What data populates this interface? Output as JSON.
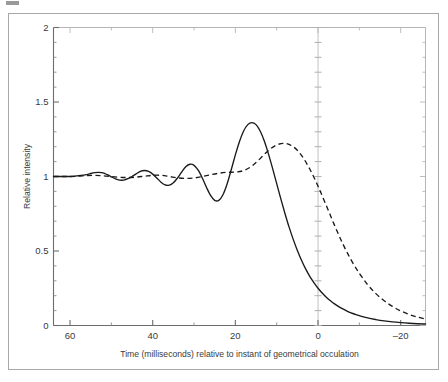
{
  "figure": {
    "corner_mark_name": "page-corner-mark",
    "frame_color": "#a8a8a8",
    "background_color": "#ffffff"
  },
  "chart_data": {
    "type": "line",
    "title": "",
    "subtitle": "",
    "xlabel": "Time (milliseconds) relative to instant of geometrical occulation",
    "ylabel": "Relative intensity",
    "xlim": [
      64,
      -26
    ],
    "ylim": [
      0,
      2
    ],
    "x_inverted": true,
    "grid": false,
    "zero_gridline": true,
    "legend": "none",
    "xticks": [
      60,
      40,
      20,
      0,
      -20
    ],
    "xtick_labels": [
      "60",
      "40",
      "20",
      "0",
      "–20"
    ],
    "xticks_minor": [
      50,
      30,
      10,
      -10
    ],
    "yticks": [
      0,
      0.5,
      1,
      1.5,
      2
    ],
    "ytick_labels": [
      "0",
      "0.5",
      "1",
      "1.5",
      "2"
    ],
    "yticks_minor": [
      0.1,
      0.2,
      0.3,
      0.4,
      0.6,
      0.7,
      0.8,
      0.9,
      1.1,
      1.2,
      1.3,
      1.4,
      1.6,
      1.7,
      1.8,
      1.9
    ],
    "series": [
      {
        "name": "monochromatic-fresnel-diffraction",
        "style": "solid",
        "color": "#1a1a1a",
        "x": [
          64,
          62,
          60,
          58,
          56,
          55,
          54,
          53,
          52,
          51,
          50,
          49,
          48,
          47,
          46,
          45,
          44,
          43,
          42,
          41,
          40,
          39,
          38,
          37,
          36,
          35,
          34,
          33,
          32,
          31,
          30,
          29,
          28,
          27,
          26,
          25,
          24,
          23,
          22,
          21,
          20,
          19,
          18,
          17,
          16,
          15,
          14,
          13,
          12,
          11,
          10,
          9,
          8,
          7,
          6,
          5,
          4,
          3,
          2,
          1,
          0,
          -1,
          -2,
          -3,
          -4,
          -5,
          -6,
          -7,
          -8,
          -9,
          -10,
          -12,
          -14,
          -16,
          -18,
          -20,
          -22,
          -24,
          -26
        ],
        "y": [
          1.0,
          1.0,
          1.0,
          1.005,
          1.012,
          1.02,
          1.026,
          1.028,
          1.024,
          1.012,
          0.998,
          0.984,
          0.976,
          0.976,
          0.985,
          1.0,
          1.018,
          1.034,
          1.04,
          1.034,
          1.016,
          0.99,
          0.962,
          0.944,
          0.942,
          0.958,
          0.99,
          1.03,
          1.065,
          1.082,
          1.075,
          1.042,
          0.99,
          0.928,
          0.873,
          0.84,
          0.84,
          0.878,
          0.95,
          1.045,
          1.145,
          1.235,
          1.305,
          1.348,
          1.362,
          1.348,
          1.305,
          1.238,
          1.152,
          1.055,
          0.952,
          0.85,
          0.752,
          0.66,
          0.578,
          0.504,
          0.438,
          0.38,
          0.33,
          0.288,
          0.25,
          0.218,
          0.19,
          0.166,
          0.145,
          0.127,
          0.111,
          0.097,
          0.085,
          0.075,
          0.066,
          0.051,
          0.04,
          0.031,
          0.024,
          0.019,
          0.015,
          0.012,
          0.01
        ]
      },
      {
        "name": "finite-source-size-smoothed",
        "style": "dashed",
        "color": "#1a1a1a",
        "x": [
          64,
          62,
          60,
          58,
          56,
          54,
          52,
          50,
          48,
          46,
          44,
          42,
          40,
          38,
          36,
          34,
          32,
          30,
          28,
          26,
          24,
          22,
          20,
          18,
          16,
          14,
          12,
          10,
          8,
          6,
          4,
          2,
          0,
          -2,
          -4,
          -6,
          -8,
          -10,
          -12,
          -14,
          -16,
          -18,
          -20,
          -22,
          -24,
          -26
        ],
        "y": [
          1.0,
          1.0,
          1.0,
          1.002,
          1.006,
          1.008,
          1.005,
          1.0,
          0.995,
          0.993,
          0.996,
          1.002,
          1.008,
          1.008,
          1.0,
          0.991,
          0.987,
          0.99,
          1.0,
          1.012,
          1.022,
          1.028,
          1.03,
          1.04,
          1.07,
          1.12,
          1.175,
          1.212,
          1.222,
          1.2,
          1.142,
          1.05,
          0.935,
          0.805,
          0.672,
          0.548,
          0.44,
          0.35,
          0.274,
          0.214,
          0.166,
          0.128,
          0.098,
          0.075,
          0.057,
          0.043
        ]
      }
    ],
    "annotations": []
  }
}
